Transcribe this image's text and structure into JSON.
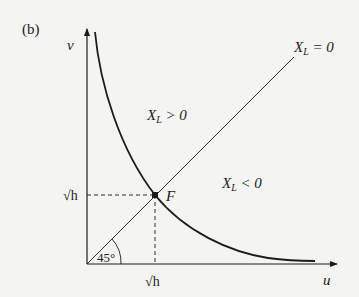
{
  "figure": {
    "panel_label": "(b)",
    "axes": {
      "x_label": "u",
      "y_label": "v"
    },
    "lines": {
      "diagonal_label_var": "X",
      "diagonal_label_sub": "L",
      "diagonal_label_rest": " = 0"
    },
    "regions": {
      "upper_var": "X",
      "upper_sub": "L",
      "upper_rest": " > 0",
      "lower_var": "X",
      "lower_sub": "L",
      "lower_rest": " < 0"
    },
    "point": {
      "label": "F",
      "x_tick": "√h",
      "y_tick": "√h"
    },
    "angle_label": "45°"
  },
  "colors": {
    "ink": "#1c1c1c",
    "background": "#f4f4f2"
  }
}
